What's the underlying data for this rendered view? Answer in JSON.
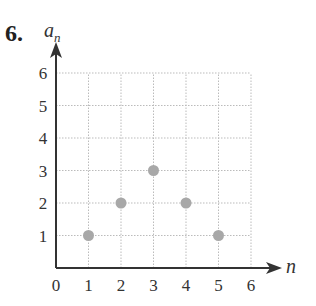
{
  "problem_number": "6.",
  "chart_data": {
    "type": "scatter",
    "title": "",
    "xlabel": "n",
    "ylabel": "a_n",
    "x": [
      1,
      2,
      3,
      4,
      5
    ],
    "y": [
      1,
      2,
      3,
      2,
      1
    ],
    "series": [
      {
        "name": "a_n",
        "x": [
          1,
          2,
          3,
          4,
          5
        ],
        "y": [
          1,
          2,
          3,
          2,
          1
        ]
      }
    ],
    "xlim": [
      0,
      6
    ],
    "ylim": [
      0,
      6
    ],
    "x_ticks": [
      "0",
      "1",
      "2",
      "3",
      "4",
      "5",
      "6"
    ],
    "y_ticks": [
      "1",
      "2",
      "3",
      "4",
      "5",
      "6"
    ],
    "grid": true,
    "legend": null,
    "point_color": "#a8a8a8"
  },
  "labels": {
    "x_axis": "n",
    "y_axis_main": "a",
    "y_axis_sub": "n"
  }
}
